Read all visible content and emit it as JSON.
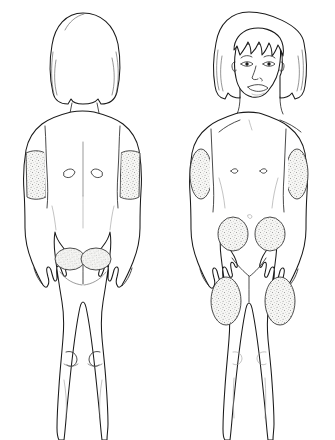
{
  "illustration": {
    "title": "Injection site diagram",
    "subject": "child figure",
    "background_color": "#ffffff",
    "outline_color": "#1a1a1a",
    "detail_color": "#2b2b2b",
    "stipple_color": "#8c8c8c",
    "site_fill_color": "#f5f5f3",
    "width": 335,
    "height": 440
  },
  "figures": [
    {
      "id": "posterior-figure",
      "view_label": "Back view",
      "position": "left",
      "hair_style": "bob",
      "face_visible": false,
      "injection_sites": [
        {
          "id": "back-left-upper-arm",
          "label": "Left upper arm",
          "shape": "band",
          "region": "upper-arm"
        },
        {
          "id": "back-right-upper-arm",
          "label": "Right upper arm",
          "shape": "band",
          "region": "upper-arm"
        },
        {
          "id": "back-left-buttock",
          "label": "Left buttock",
          "shape": "oval",
          "region": "buttock"
        },
        {
          "id": "back-right-buttock",
          "label": "Right buttock",
          "shape": "oval",
          "region": "buttock"
        }
      ],
      "anatomy_marks": [
        "scapula-left",
        "scapula-right",
        "spine-line",
        "gluteal-cleft",
        "knee-crease-left",
        "knee-crease-right",
        "calf-left",
        "calf-right"
      ]
    },
    {
      "id": "anterior-figure",
      "view_label": "Front view",
      "position": "right",
      "hair_style": "bob with bangs",
      "face_visible": true,
      "face_features": [
        "eyebrows",
        "eyes",
        "pupils",
        "nose",
        "nostrils",
        "mouth",
        "ears",
        "chin"
      ],
      "injection_sites": [
        {
          "id": "front-left-deltoid",
          "label": "Left deltoid",
          "shape": "oval",
          "region": "deltoid"
        },
        {
          "id": "front-right-deltoid",
          "label": "Right deltoid",
          "shape": "oval",
          "region": "deltoid"
        },
        {
          "id": "front-left-abdomen",
          "label": "Left abdomen",
          "shape": "oval",
          "region": "abdomen"
        },
        {
          "id": "front-right-abdomen",
          "label": "Right abdomen",
          "shape": "oval",
          "region": "abdomen"
        },
        {
          "id": "front-left-thigh",
          "label": "Left thigh",
          "shape": "oval",
          "region": "thigh"
        },
        {
          "id": "front-right-thigh",
          "label": "Right thigh",
          "shape": "oval",
          "region": "thigh"
        }
      ],
      "anatomy_marks": [
        "clavicle-left",
        "clavicle-right",
        "nipple-left",
        "nipple-right",
        "navel",
        "groin-crease",
        "knee-left",
        "knee-right"
      ]
    }
  ]
}
